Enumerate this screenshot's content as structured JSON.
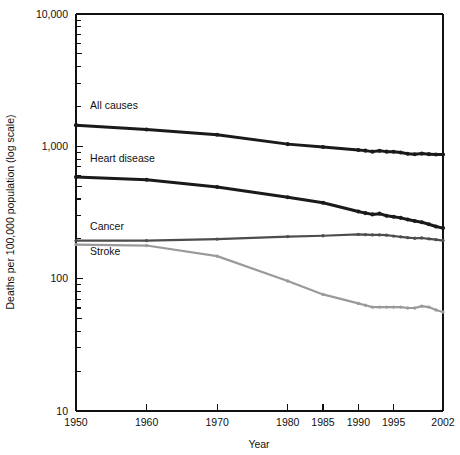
{
  "chart_data": {
    "type": "line",
    "title": "",
    "xlabel": "Year",
    "ylabel": "Deaths per 100,000 population (log scale)",
    "yscale": "log",
    "ylim": [
      10,
      10000
    ],
    "xlim": [
      1950,
      2002
    ],
    "grid": false,
    "legend": "inline-labels",
    "ytick_labels": [
      "10,000",
      "1,000",
      "100",
      "10"
    ],
    "ytick_values": [
      10000,
      1000,
      100,
      10
    ],
    "xtick_labels": [
      "1950",
      "1960",
      "1970",
      "1980",
      "1985",
      "1990",
      "1995",
      "2002"
    ],
    "xtick_values": [
      1950,
      1960,
      1970,
      1980,
      1985,
      1990,
      1995,
      2002
    ],
    "series": [
      {
        "name": "All causes",
        "color": "#1a1a1a",
        "width": 3.0,
        "label_x": 1952,
        "label_y": 1900,
        "x": [
          1950,
          1960,
          1970,
          1980,
          1985,
          1990,
          1991,
          1992,
          1993,
          1994,
          1995,
          1996,
          1997,
          1998,
          1999,
          2000,
          2001,
          2002
        ],
        "values": [
          1446,
          1339,
          1222,
          1039,
          988,
          939,
          928,
          912,
          925,
          912,
          910,
          898,
          878,
          871,
          881,
          873,
          867,
          868
        ]
      },
      {
        "name": "Heart disease",
        "color": "#1a1a1a",
        "width": 3.0,
        "label_x": 1952,
        "label_y": 760,
        "x": [
          1950,
          1960,
          1970,
          1980,
          1985,
          1990,
          1991,
          1992,
          1993,
          1994,
          1995,
          1996,
          1997,
          1998,
          1999,
          2000,
          2001,
          2002
        ],
        "values": [
          586,
          559,
          493,
          412,
          375,
          322,
          313,
          306,
          310,
          299,
          294,
          288,
          280,
          273,
          267,
          258,
          248,
          241
        ]
      },
      {
        "name": "Cancer",
        "color": "#4d4d4d",
        "width": 2.2,
        "label_x": 1952,
        "label_y": 232,
        "x": [
          1950,
          1960,
          1970,
          1980,
          1985,
          1990,
          1991,
          1992,
          1993,
          1994,
          1995,
          1996,
          1997,
          1998,
          1999,
          2000,
          2001,
          2002
        ],
        "values": [
          194,
          194,
          199,
          208,
          211,
          216,
          215,
          214,
          214,
          213,
          210,
          207,
          204,
          202,
          203,
          200,
          197,
          194
        ]
      },
      {
        "name": "Stroke",
        "color": "#9a9a9a",
        "width": 2.2,
        "label_x": 1952,
        "label_y": 150,
        "x": [
          1950,
          1960,
          1970,
          1980,
          1985,
          1990,
          1991,
          1992,
          1993,
          1994,
          1995,
          1996,
          1997,
          1998,
          1999,
          2000,
          2001,
          2002
        ],
        "values": [
          181,
          178,
          148,
          96,
          76,
          65,
          63,
          61,
          61,
          61,
          61,
          61,
          60,
          60,
          62,
          61,
          58,
          56
        ]
      }
    ]
  },
  "axis_titles": {
    "x": "Year",
    "y": "Deaths per 100,000 population (log scale)"
  }
}
